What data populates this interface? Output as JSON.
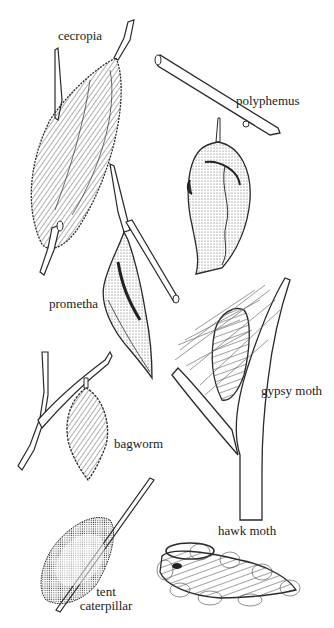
{
  "figure": {
    "ink_color": "#2a2a2a",
    "paper_color": "#ffffff",
    "specimens": [
      {
        "id": "cecropia",
        "label": "cecropia"
      },
      {
        "id": "polyphemus",
        "label": "polyphemus"
      },
      {
        "id": "prometha",
        "label": "prometha"
      },
      {
        "id": "gypsy-moth",
        "label": "gypsy moth"
      },
      {
        "id": "bagworm",
        "label": "bagworm"
      },
      {
        "id": "tent-caterpillar",
        "label_line1": "tent",
        "label_line2": "caterpillar"
      },
      {
        "id": "hawk-moth",
        "label": "hawk moth"
      }
    ]
  }
}
